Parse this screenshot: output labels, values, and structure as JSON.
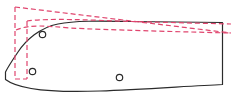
{
  "canvas": {
    "width": 231,
    "height": 95,
    "background": "#ffffff",
    "title": "CAD Panel Outline Overlay"
  },
  "style": {
    "solid_color": "#2b2b2b",
    "solid_width": 1.2,
    "dashed_color": "#e0456e",
    "dashed_width": 1.2,
    "dash_pattern": "5 3",
    "hole_stroke": "#2b2b2b",
    "hole_fill": "#ffffff",
    "hole_width": 1.2
  },
  "shapes": {
    "solid_outline": {
      "name": "panel-outline",
      "label": "Panel outline",
      "path": "M 5.5 72 L 5.5 79.5 C 20 90.5 60 92.5 100 91 C 140 89.5 190 86 222.5 84.5 L 222.5 22.5 L 130 21.5 C 100 21 75 20.5 58 24 C 40 27.5 26 40 18 52 C 11.5 61.5 7.5 68 5.5 72 Z"
    },
    "dashed_outline": {
      "name": "reference-outline",
      "label": "Reference outline",
      "segments": [
        {
          "name": "reference-top-edge",
          "path": "M 15 7 L 231 33"
        },
        {
          "name": "reference-left-edge",
          "path": "M 15 7 L 15 79"
        },
        {
          "name": "reference-inner-left-edge",
          "path": "M 27 21 L 27 79"
        },
        {
          "name": "reference-lower-curve",
          "path": "M 15 79 L 27 79"
        },
        {
          "name": "reference-offset-curve",
          "path": "M 16 30 C 30 24 46 26 70 28 C 110 30 170 31.5 231 33"
        },
        {
          "name": "reference-upper-tangent",
          "path": "M 27 21 C 50 18 90 20 130 21.5 L 231 24"
        }
      ]
    },
    "holes": [
      {
        "name": "hole-upper-left",
        "cx": 42.5,
        "cy": 34.5,
        "r": 3.2
      },
      {
        "name": "hole-lower-left",
        "cx": 32.5,
        "cy": 71.5,
        "r": 3.2
      },
      {
        "name": "hole-lower-center",
        "cx": 119.5,
        "cy": 77.5,
        "r": 3.2
      }
    ]
  }
}
